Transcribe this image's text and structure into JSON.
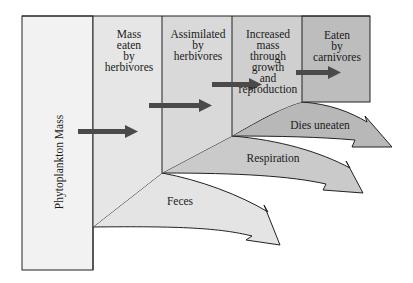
{
  "diagram": {
    "type": "energy-flow",
    "stages": [
      {
        "id": "phytoplankton",
        "label": "Phytoplankton Mass",
        "orientation": "vertical"
      },
      {
        "id": "eaten",
        "label": "Mass eaten by herbivores",
        "lines": [
          "Mass",
          "eaten",
          "by",
          "herbivores"
        ]
      },
      {
        "id": "assimilated",
        "label": "Assimilated by herbivores",
        "lines": [
          "Assimilated",
          "by",
          "herbivores"
        ]
      },
      {
        "id": "growth",
        "label": "Increased mass through growth and reproduction",
        "lines": [
          "Increased",
          "mass",
          "through",
          "growth",
          "and",
          "reproduction"
        ]
      },
      {
        "id": "carnivores",
        "label": "Eaten by carnivores",
        "lines": [
          "Eaten",
          "by",
          "carnivores"
        ]
      }
    ],
    "losses": [
      {
        "id": "feces",
        "label": "Feces"
      },
      {
        "id": "respiration",
        "label": "Respiration"
      },
      {
        "id": "dies-uneaten",
        "label": "Dies uneaten"
      }
    ],
    "colors": {
      "col1": "#f2f2f2",
      "col2": "#e6e6e6",
      "col3": "#d9d9d9",
      "col4": "#cfcfcf",
      "col5": "#bdbdbd",
      "feces": "#e4e4e4",
      "respiration": "#cacaca",
      "dies": "#b8b8b8",
      "arrow": "#4a4a4a",
      "border": "#222222"
    }
  }
}
